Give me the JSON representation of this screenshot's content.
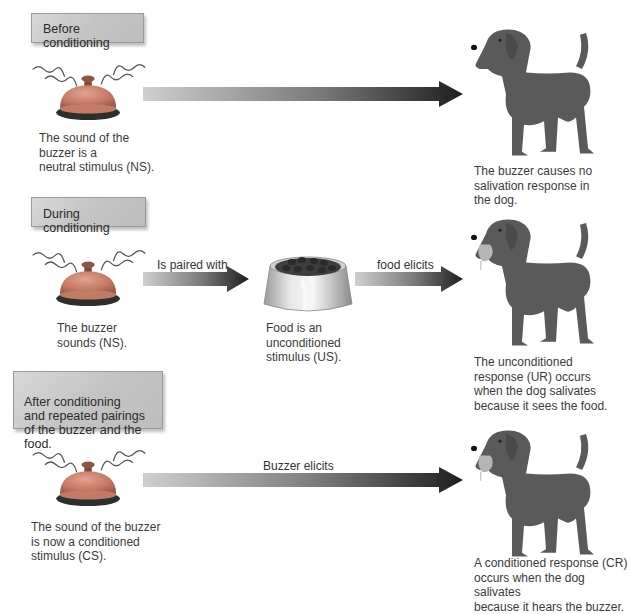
{
  "panels": [
    {
      "id": "before",
      "heading": "Before conditioning",
      "stimulus_caption": "The sound of the\nbuzzer is a\nneutral stimulus (NS).",
      "arrow_label": "",
      "response_caption": "The buzzer causes no\nsalivation response in\nthe dog.",
      "dog_salivating": false
    },
    {
      "id": "during",
      "heading": "During conditioning",
      "stimulus_caption": "The buzzer\nsounds (NS).",
      "pairing_arrow_label": "Is paired with",
      "food_caption": "Food is an\nunconditioned\nstimulus (US).",
      "arrow_label": "food elicits",
      "response_caption": "The unconditioned\nresponse (UR) occurs\nwhen the dog salivates\nbecause it sees the food.",
      "dog_salivating": true
    },
    {
      "id": "after",
      "heading": "After conditioning\nand repeated pairings\nof the buzzer and the food.",
      "stimulus_caption": "The sound of the buzzer\nis now a conditioned\nstimulus (CS).",
      "arrow_label": "Buzzer elicits",
      "response_caption": "A conditioned response (CR)\noccurs when the dog salivates\nbecause it hears the buzzer.",
      "dog_salivating": true
    }
  ],
  "colors": {
    "bell_dome": "#c9826d",
    "bell_base": "#3a3a3a",
    "dog_body": "#5a5a5a",
    "tongue": "#b7b7b7",
    "arrow_start": "#c8c8c8",
    "arrow_end": "#1e1e1e",
    "label_box": "#c8c8c8"
  }
}
